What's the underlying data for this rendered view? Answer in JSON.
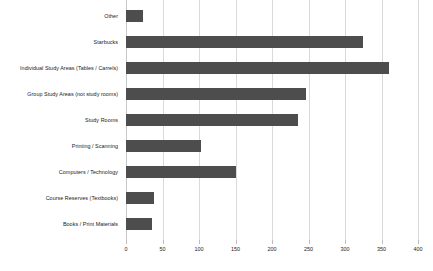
{
  "chart_data": {
    "type": "bar",
    "orientation": "horizontal",
    "title": "",
    "subtitle": "",
    "xlabel": "",
    "ylabel": "",
    "xlim": [
      0,
      400
    ],
    "xticks": [
      0,
      50,
      100,
      150,
      200,
      250,
      300,
      350,
      400
    ],
    "xtick_labels": [
      "0",
      "50",
      "100",
      "150",
      "200",
      "250",
      "300",
      "350",
      "400"
    ],
    "grid": "vertical",
    "legend": "none",
    "bar_color": "#4d4d4d",
    "gridline_color": "#d9d9d9",
    "background_color": "#ffffff",
    "categories": [
      "Other",
      "Starbucks",
      "Individual Study Areas (Tables / Carrels)",
      "Group Study Areas (not study rooms)",
      "Study Rooms",
      "Printing / Scanning",
      "Computers / Technology",
      "Course Reserves (Textbooks)",
      "Books / Print Materials"
    ],
    "values": [
      23,
      325,
      360,
      246,
      235,
      103,
      150,
      38,
      35
    ]
  }
}
